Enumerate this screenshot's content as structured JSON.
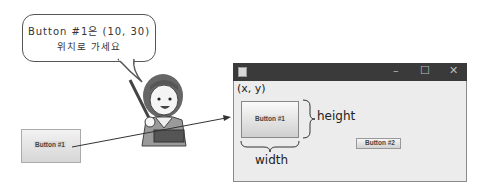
{
  "speech_bubble": {
    "line1": "Button #1은 (10, 30)",
    "line2": "위치로 가세요"
  },
  "floating_button": {
    "label": "Button #1"
  },
  "window": {
    "title_controls": {
      "minimize": "–",
      "maximize": "☐",
      "close": "✕"
    },
    "origin_label": "(x, y)",
    "button1": {
      "label": "Button #1"
    },
    "button2": {
      "label": "Button #2"
    },
    "height_label": "height",
    "width_label": "width"
  },
  "colors": {
    "titlebar": "#3a3a3a",
    "window_bg": "#ececec",
    "button_top": "#fafafa",
    "button_bottom": "#cfcfcf"
  }
}
